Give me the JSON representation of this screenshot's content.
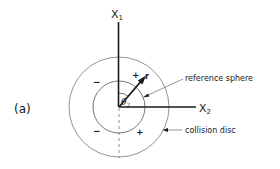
{
  "figure": {
    "panel_label": "(a)",
    "axes": {
      "vertical": {
        "label": "X",
        "subscript": "1"
      },
      "horizontal": {
        "label": "X",
        "subscript": "2"
      }
    },
    "vector": {
      "label": "r"
    },
    "angle": {
      "label": "θ",
      "subscript": "2"
    },
    "annotations": {
      "inner_circle": "reference sphere",
      "outer_circle": "collision disc"
    },
    "signs": {
      "upper_left": "−",
      "upper_right": "+",
      "lower_left": "−",
      "lower_right": "+"
    },
    "colors": {
      "line": "#1a1a1a",
      "thin_line": "#555555",
      "background": "#ffffff"
    }
  }
}
